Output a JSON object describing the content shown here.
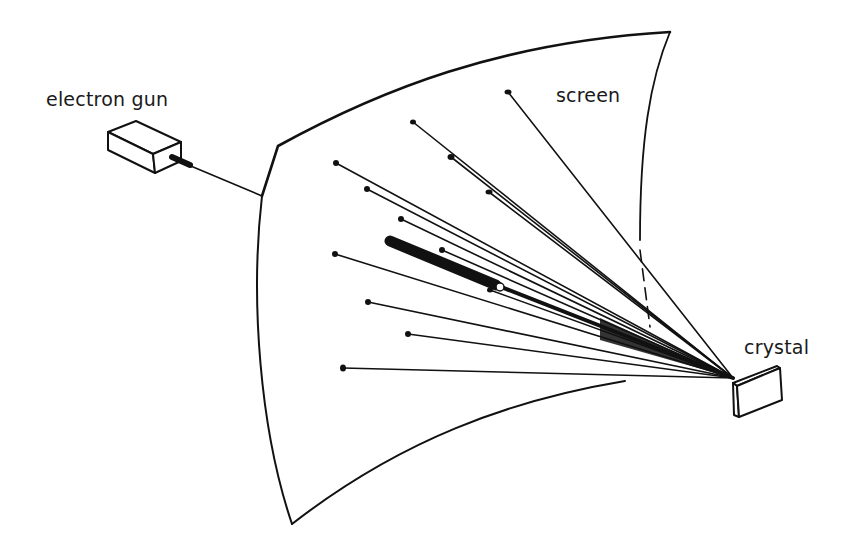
{
  "diagram": {
    "type": "physics-schematic",
    "labels": {
      "electron_gun": "electron gun",
      "screen": "screen",
      "crystal": "crystal"
    },
    "colors": {
      "ink": "#111111",
      "background": "#ffffff"
    },
    "convergence_point": [
      733,
      378
    ],
    "diffraction_spots": [
      [
        508,
        92
      ],
      [
        413,
        122
      ],
      [
        451,
        157
      ],
      [
        336,
        163
      ],
      [
        367,
        189
      ],
      [
        489,
        192
      ],
      [
        401,
        219
      ],
      [
        442,
        250
      ],
      [
        335,
        254
      ],
      [
        490,
        290
      ],
      [
        368,
        302
      ],
      [
        408,
        334
      ],
      [
        343,
        368
      ]
    ],
    "main_beam": {
      "from": [
        390,
        241
      ],
      "to": [
        500,
        287
      ]
    }
  }
}
